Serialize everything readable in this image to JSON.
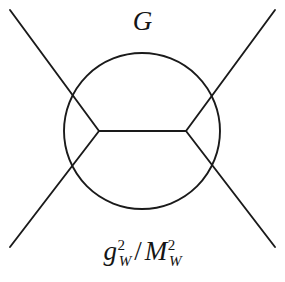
{
  "figure": {
    "type": "feynman-diagram",
    "background_color": "#ffffff",
    "stroke_color": "#1a1a1a",
    "text_color": "#151515",
    "width": 285,
    "height": 282
  },
  "labels": {
    "top": {
      "name": "coupling-G",
      "text": "G",
      "plain": "G",
      "style": "italic-serif"
    },
    "bottom": {
      "name": "coupling-ratio",
      "plain": "g_W^2 / M_W^2",
      "numerator_symbol": "g",
      "numerator_subscript": "W",
      "numerator_superscript": "2",
      "divider": "/",
      "denominator_symbol": "M",
      "denominator_subscript": "W",
      "denominator_superscript": "2",
      "style": "italic-serif"
    }
  },
  "geometry": {
    "blob_circle": {
      "cx": 142,
      "cy": 131,
      "r": 78
    },
    "vertex_left": {
      "x": 99,
      "y": 131
    },
    "vertex_right": {
      "x": 186,
      "y": 131
    },
    "propagator": {
      "x1": 99,
      "y1": 131,
      "x2": 186,
      "y2": 131
    },
    "legs": [
      {
        "name": "leg-upper-left",
        "x1": 10,
        "y1": 10,
        "x2": 99,
        "y2": 131
      },
      {
        "name": "leg-lower-left",
        "x1": 10,
        "y1": 247,
        "x2": 99,
        "y2": 131
      },
      {
        "name": "leg-upper-right",
        "x1": 275,
        "y1": 10,
        "x2": 186,
        "y2": 131
      },
      {
        "name": "leg-lower-right",
        "x1": 275,
        "y1": 247,
        "x2": 186,
        "y2": 131
      }
    ],
    "stroke_width": 1.9
  }
}
